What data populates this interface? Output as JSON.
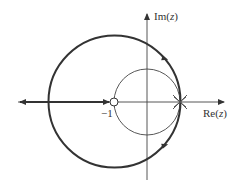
{
  "diagram": {
    "type": "root-locus",
    "axes": {
      "real_label_prefix": "Re(",
      "real_label_var": "z",
      "real_label_suffix": ")",
      "imag_label_prefix": "Im(",
      "imag_label_var": "z",
      "imag_label_suffix": ")"
    },
    "markers": {
      "zero_label": "−1",
      "zero_position": -1,
      "poles_position": 1,
      "pole_count": 2
    },
    "curves": {
      "unit_circle": "unit circle (thin)",
      "locus_circle": "root locus circle centered at −1 (thick)",
      "locus_real_axis": "root locus on real axis from −1 to −∞"
    },
    "colors": {
      "stroke": "#333333",
      "thin_stroke": "#444444",
      "background": "#ffffff"
    }
  }
}
